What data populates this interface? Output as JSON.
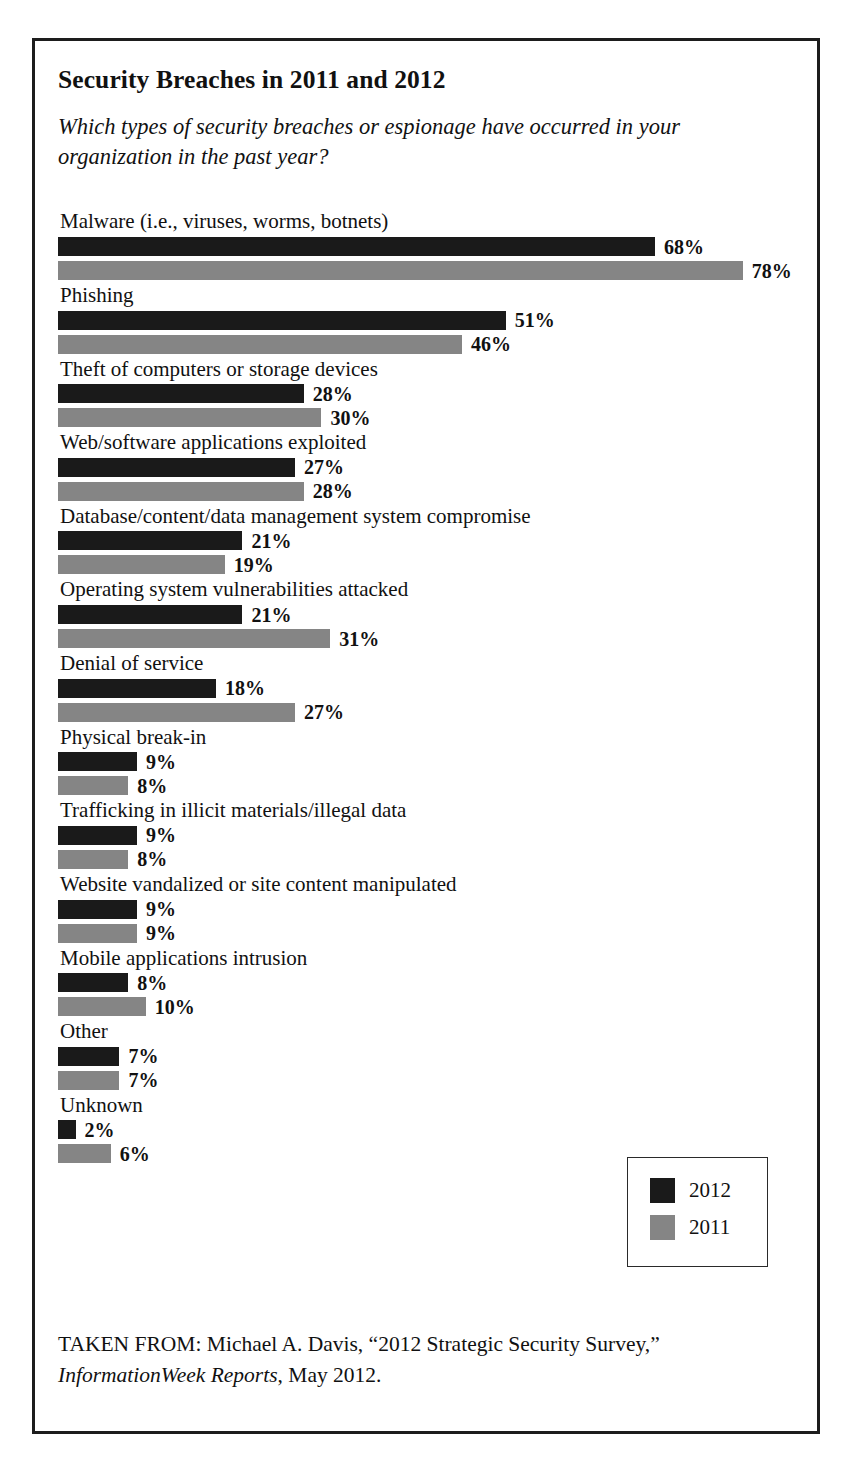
{
  "figure": {
    "title": "Security Breaches in 2011 and 2012",
    "question": "Which types of security breaches or espionage have occurred in your organization in the past year?",
    "source_prefix": "TAKEN FROM: Michael A. Davis, “2012 Strategic Security Survey,” ",
    "source_publication": "InformationWeek Reports",
    "source_suffix": ", May 2012."
  },
  "legend": {
    "items": [
      {
        "label": "2012",
        "color": "#1a1a1a"
      },
      {
        "label": "2011",
        "color": "#858585"
      }
    ]
  },
  "chart_data": {
    "type": "bar",
    "orientation": "horizontal",
    "title": "Security Breaches in 2011 and 2012",
    "subtitle": "Which types of security breaches or espionage have occurred in your organization in the past year?",
    "xlabel": "",
    "ylabel": "",
    "xlim": [
      0,
      80
    ],
    "grid": false,
    "legend_position": "bottom-right",
    "value_suffix": "%",
    "categories": [
      "Malware (i.e., viruses, worms, botnets)",
      "Phishing",
      "Theft of computers or storage devices",
      "Web/software applications exploited",
      "Database/content/data management system compromise",
      "Operating system vulnerabilities attacked",
      "Denial of service",
      "Physical break-in",
      "Trafficking in illicit materials/illegal data",
      "Website vandalized or site content manipulated",
      "Mobile applications intrusion",
      "Other",
      "Unknown"
    ],
    "series": [
      {
        "name": "2012",
        "color": "#1a1a1a",
        "values": [
          68,
          51,
          28,
          27,
          21,
          21,
          18,
          9,
          9,
          9,
          8,
          7,
          2
        ],
        "labels": [
          "68%",
          "51%",
          "28%",
          "27%",
          "21%",
          "21%",
          "18%",
          "9%",
          "9%",
          "9%",
          "8%",
          "7%",
          "2%"
        ]
      },
      {
        "name": "2011",
        "color": "#858585",
        "values": [
          78,
          46,
          30,
          28,
          19,
          31,
          27,
          8,
          8,
          9,
          10,
          7,
          6
        ],
        "labels": [
          "78%",
          "46%",
          "30%",
          "28%",
          "19%",
          "31%",
          "27%",
          "8%",
          "8%",
          "9%",
          "10%",
          "7%",
          "6%"
        ]
      }
    ]
  }
}
